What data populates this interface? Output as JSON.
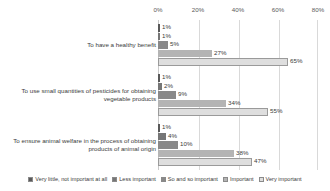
{
  "chart_data": {
    "type": "bar",
    "orientation": "horizontal",
    "title": "",
    "xlabel": "",
    "ylabel": "",
    "xlim": [
      0,
      80
    ],
    "grid": true,
    "legend_position": "bottom",
    "xticks": [
      "0%",
      "20%",
      "40%",
      "60%",
      "80%"
    ],
    "xtick_values": [
      0,
      20,
      40,
      60,
      80
    ],
    "categories": [
      "To have a healthy benefit",
      "To use small quantities of pesticides for obtaining vegetable products",
      "To ensure animal welfare in the process of obtaining products of animal origin"
    ],
    "series": [
      {
        "name": "Very little, not important at all",
        "color": "#595959",
        "values": [
          1,
          1,
          1
        ],
        "labels": [
          "1%",
          "1%",
          "1%"
        ]
      },
      {
        "name": "Less important",
        "color": "#767676",
        "values": [
          1,
          2,
          4
        ],
        "labels": [
          "1%",
          "2%",
          "4%"
        ]
      },
      {
        "name": "So and so important",
        "color": "#898989",
        "values": [
          5,
          9,
          10
        ],
        "labels": [
          "5%",
          "9%",
          "10%"
        ]
      },
      {
        "name": "Important",
        "color": "#b4b4b4",
        "values": [
          27,
          34,
          38
        ],
        "labels": [
          "27%",
          "34%",
          "38%"
        ]
      },
      {
        "name": "Very important",
        "color": "#dedede",
        "values": [
          65,
          55,
          47
        ],
        "labels": [
          "65%",
          "55%",
          "47%"
        ]
      }
    ]
  }
}
